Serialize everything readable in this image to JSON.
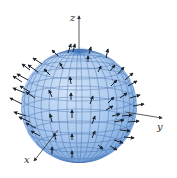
{
  "figure": {
    "axes": {
      "z_label": "z",
      "y_label": "y",
      "x_label": "x"
    },
    "colors": {
      "sphere_fill": "#a9c8ee",
      "sphere_shade": "#6f9fd8",
      "sphere_cap": "#3f7fd0",
      "grid": "#2a5a9a",
      "vector": "#1c2430",
      "axis": "#333333"
    },
    "sphere": {
      "cx": 79,
      "cy": 106,
      "rx": 58,
      "ry": 57
    }
  }
}
